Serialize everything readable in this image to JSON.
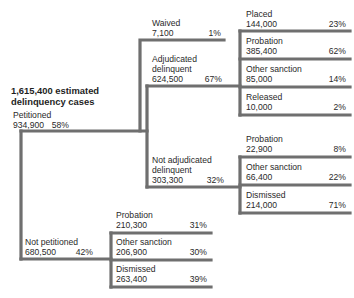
{
  "diagram": {
    "title_lines": [
      "1,615,400 estimated",
      "delinquency cases"
    ],
    "nodes": {
      "petitioned": {
        "name": "Petitioned",
        "count": "934,900",
        "pct": "58%"
      },
      "not_petitioned": {
        "name": "Not petitioned",
        "count": "680,500",
        "pct": "42%"
      },
      "waived": {
        "name": "Waived",
        "count": "7,100",
        "pct": "1%"
      },
      "adjudicated": {
        "name": "Adjudicated\ndelinquent",
        "count": "624,500",
        "pct": "67%"
      },
      "not_adjudicated": {
        "name": "Not adjudicated\ndelinquent",
        "count": "303,300",
        "pct": "32%"
      },
      "adj_placed": {
        "name": "Placed",
        "count": "144,000",
        "pct": "23%"
      },
      "adj_probation": {
        "name": "Probation",
        "count": "385,400",
        "pct": "62%"
      },
      "adj_other": {
        "name": "Other sanction",
        "count": "85,000",
        "pct": "14%"
      },
      "adj_released": {
        "name": "Released",
        "count": "10,000",
        "pct": "2%"
      },
      "nadj_probation": {
        "name": "Probation",
        "count": "22,900",
        "pct": "8%"
      },
      "nadj_other": {
        "name": "Other sanction",
        "count": "66,400",
        "pct": "22%"
      },
      "nadj_dismissed": {
        "name": "Dismissed",
        "count": "214,000",
        "pct": "71%"
      },
      "np_probation": {
        "name": "Probation",
        "count": "210,300",
        "pct": "31%"
      },
      "np_other": {
        "name": "Other sanction",
        "count": "206,900",
        "pct": "30%"
      },
      "np_dismissed": {
        "name": "Dismissed",
        "count": "263,400",
        "pct": "39%"
      }
    },
    "colors": {
      "line": "#6f6f6f",
      "text": "#2a2a2a"
    }
  }
}
